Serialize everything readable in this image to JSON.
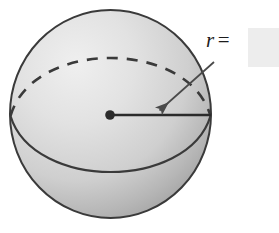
{
  "figure": {
    "background_color": "#ffffff",
    "width": 279,
    "height": 233
  },
  "sphere": {
    "name": "sphere",
    "fill_light_color": "#e4e4e4",
    "fill_dark_color": "#a9a9a9",
    "outline_color": "#3a3a3a",
    "center": {
      "x": 110,
      "y": 115
    },
    "radius_x": 100,
    "radius_y": 104,
    "equator_front_style": "solid",
    "equator_back_style": "dashed",
    "center_dot_color": "#2b2b2b",
    "center_dot_diameter": 9
  },
  "radius_line": {
    "name": "radius-segment",
    "from": {
      "x": 110,
      "y": 115
    },
    "to": {
      "x": 211,
      "y": 115
    },
    "color": "#2b2b2b"
  },
  "leader_arrow": {
    "name": "leader-arrow",
    "from": {
      "x": 214,
      "y": 62
    },
    "to": {
      "x": 157,
      "y": 112
    },
    "color": "#4a4a4a",
    "head": "triangle"
  },
  "label": {
    "variable": "r",
    "equals": "=",
    "full_text": "r ="
  },
  "answer_field": {
    "name": "radius-answer-input",
    "value": "",
    "placeholder": "",
    "fill_color": "#ededed"
  }
}
